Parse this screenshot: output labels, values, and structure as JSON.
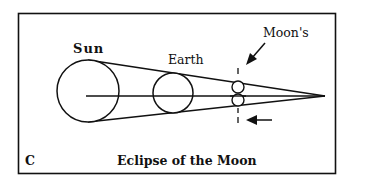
{
  "diagram": {
    "panel_letter": "C",
    "title": "Eclipse of the Moon",
    "labels": {
      "sun": "Sun",
      "earth": "Earth",
      "moon": "Moon's"
    },
    "colors": {
      "stroke": "#111111",
      "background": "#ffffff"
    }
  }
}
